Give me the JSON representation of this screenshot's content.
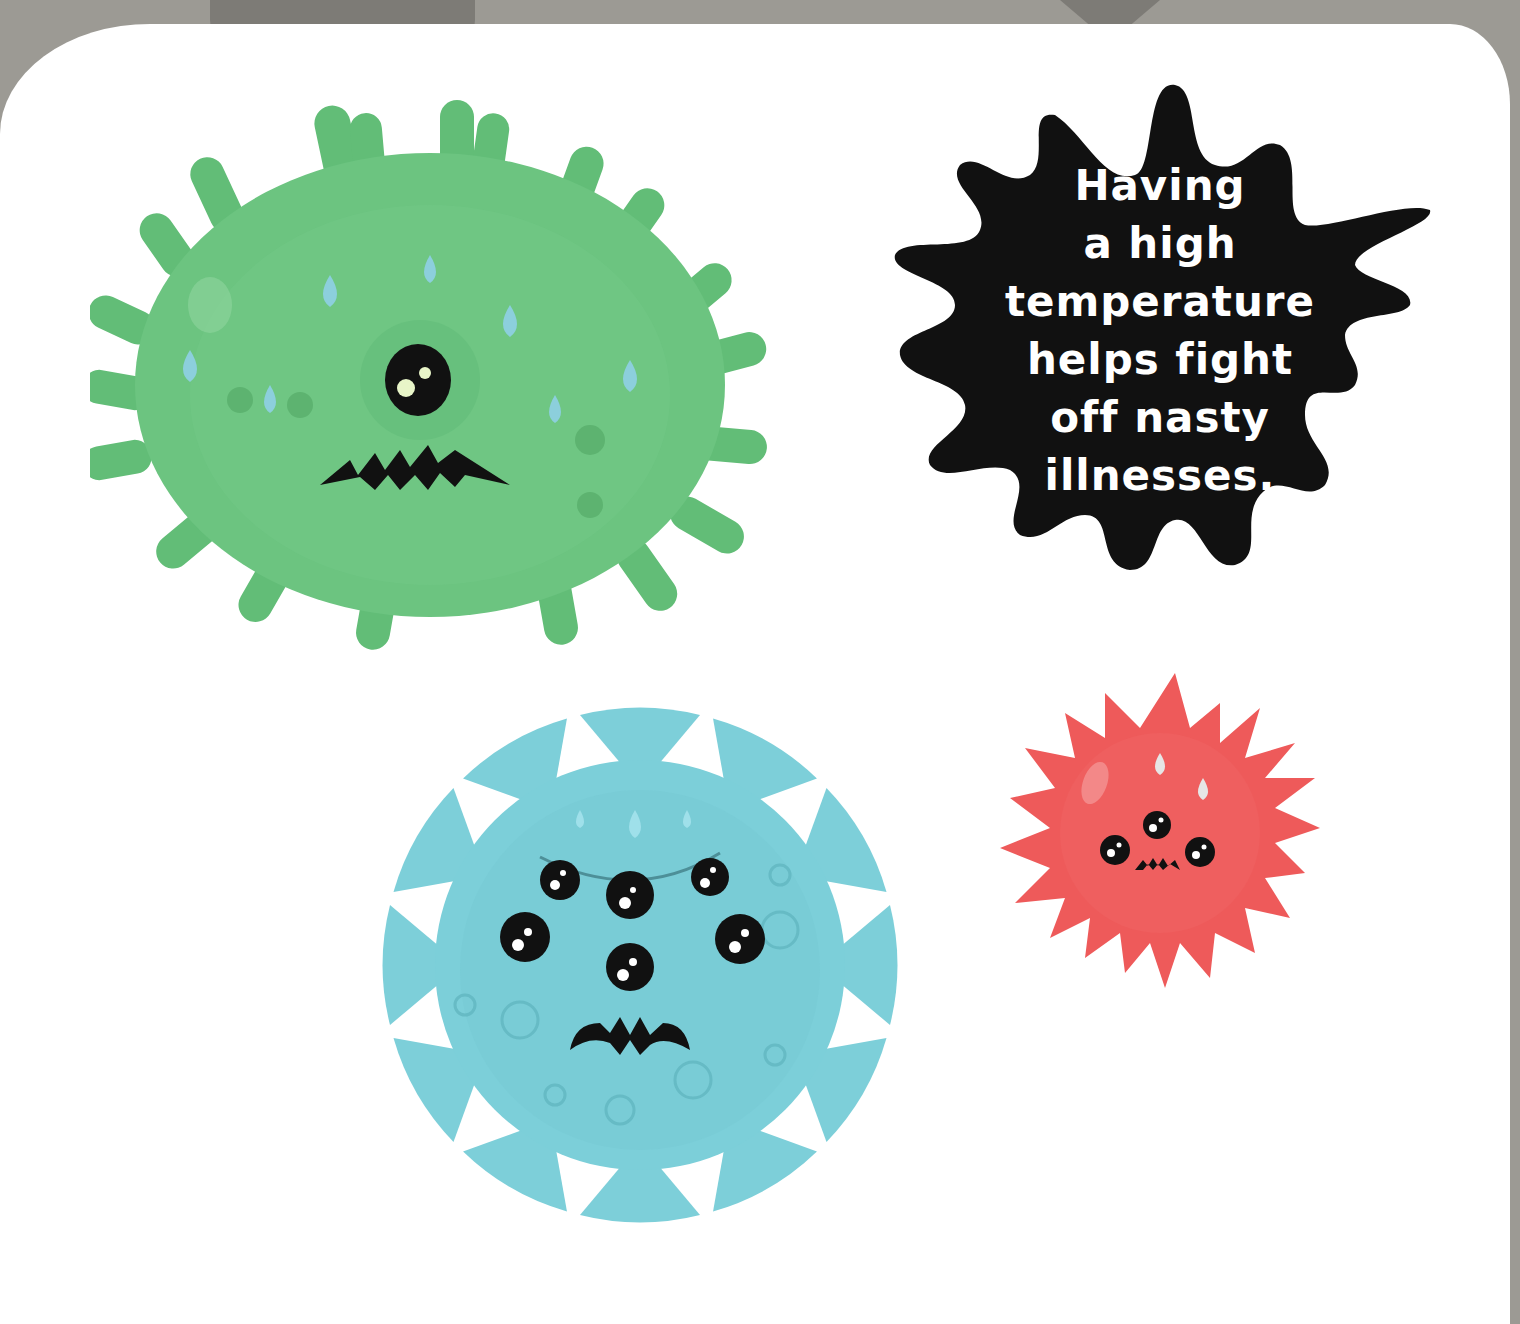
{
  "page": {
    "background_color": "#9c9a94",
    "paper_color": "#ffffff"
  },
  "fact_bubble": {
    "lines": [
      "Having",
      "a high",
      "temperature",
      "helps fight",
      "off nasty",
      "illnesses."
    ],
    "fill_color": "#111111",
    "text_color": "#ffffff"
  },
  "germs": [
    {
      "name": "green-germ",
      "color": "#6cc480",
      "eyes": 1,
      "expression": "worried-zigzag-mouth",
      "sweat_drops": 8
    },
    {
      "name": "blue-germ",
      "color": "#7dcfd9",
      "eyes": 6,
      "expression": "angry-frown",
      "sweat_drops": 3
    },
    {
      "name": "red-germ",
      "color": "#ee5a5a",
      "eyes": 3,
      "expression": "angry-zigzag-mouth",
      "sweat_drops": 2
    }
  ]
}
